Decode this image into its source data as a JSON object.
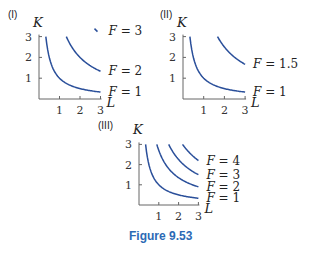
{
  "caption": "Figure 9.53",
  "chart_data": [
    {
      "type": "line",
      "panel_label": "(I)",
      "xlabel": "L",
      "ylabel": "K",
      "xlim": [
        0,
        3
      ],
      "ylim": [
        0,
        3
      ],
      "x_ticks": [
        "1",
        "2",
        "3"
      ],
      "y_ticks": [
        "1",
        "2",
        "3"
      ],
      "series": [
        {
          "name": "F = 1",
          "label": "F = 1",
          "product_KL": 1
        },
        {
          "name": "F = 2",
          "label": "F = 2",
          "product_KL": 4
        },
        {
          "name": "F = 3",
          "label": "F = 3",
          "product_KL": 9
        }
      ]
    },
    {
      "type": "line",
      "panel_label": "(II)",
      "xlabel": "L",
      "ylabel": "K",
      "xlim": [
        0,
        3
      ],
      "ylim": [
        0,
        3
      ],
      "x_ticks": [
        "1",
        "2",
        "3"
      ],
      "y_ticks": [
        "1",
        "2",
        "3"
      ],
      "series": [
        {
          "name": "F = 1",
          "label": "F = 1",
          "product_KL": 1
        },
        {
          "name": "F = 1.5",
          "label": "F = 1.5",
          "product_KL": 5
        }
      ]
    },
    {
      "type": "line",
      "panel_label": "(III)",
      "xlabel": "L",
      "ylabel": "K",
      "xlim": [
        0,
        3
      ],
      "ylim": [
        0,
        3
      ],
      "x_ticks": [
        "1",
        "2",
        "3"
      ],
      "y_ticks": [
        "1",
        "2",
        "3"
      ],
      "series": [
        {
          "name": "F = 1",
          "label": "F = 1",
          "product_KL": 1
        },
        {
          "name": "F = 2",
          "label": "F = 2",
          "product_KL": 2.7
        },
        {
          "name": "F = 3",
          "label": "F = 3",
          "product_KL": 4.5
        },
        {
          "name": "F = 4",
          "label": "F = 4",
          "product_KL": 6.6
        }
      ]
    }
  ]
}
